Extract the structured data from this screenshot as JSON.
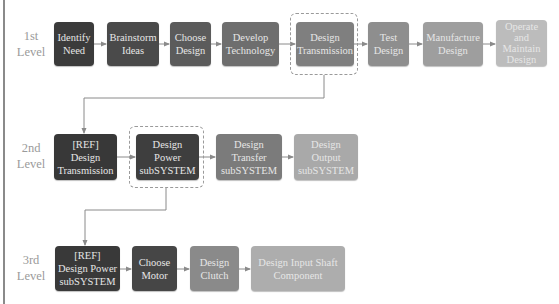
{
  "levels": [
    {
      "label": "1st\nLevel"
    },
    {
      "label": "2nd\nLevel"
    },
    {
      "label": "3rd\nLevel"
    }
  ],
  "level1": [
    {
      "label": "Identify\nNeed",
      "color": "#3b3b3b"
    },
    {
      "label": "Brainstorm\nIdeas",
      "color": "#4a4a4a"
    },
    {
      "label": "Choose\nDesign",
      "color": "#5b5b5b"
    },
    {
      "label": "Develop\nTechnology",
      "color": "#6e6e6e"
    },
    {
      "label": "Design\nTransmission",
      "color": "#7f7f7f"
    },
    {
      "label": "Test\nDesign",
      "color": "#8e8e8e"
    },
    {
      "label": "Manufacture\nDesign",
      "color": "#9e9e9e"
    },
    {
      "label": "Operate\nand\nMaintain\nDesign",
      "color": "#bcbcbc"
    }
  ],
  "level2": [
    {
      "label": "[REF]\nDesign\nTransmission",
      "color": "#383838"
    },
    {
      "label": "Design\nPower\nsubSYSTEM",
      "color": "#3e3e3e"
    },
    {
      "label": "Design\nTransfer\nsubSYSTEM",
      "color": "#7b7b7b"
    },
    {
      "label": "Design\nOutput\nsubSYSTEM",
      "color": "#a9a9a9"
    }
  ],
  "level3": [
    {
      "label": "[REF]\nDesign Power\nsubSYSTEM",
      "color": "#393939"
    },
    {
      "label": "Choose\nMotor",
      "color": "#464646"
    },
    {
      "label": "Design\nClutch",
      "color": "#8a8a8a"
    },
    {
      "label": "Design Input Shaft\nComponent",
      "color": "#adadad"
    }
  ],
  "colors": {
    "connector": "#8a8a8a",
    "dashed_highlight": "#9a9a9a",
    "label_text": "#9a9a9a",
    "node_text": "#e6e6e6"
  }
}
